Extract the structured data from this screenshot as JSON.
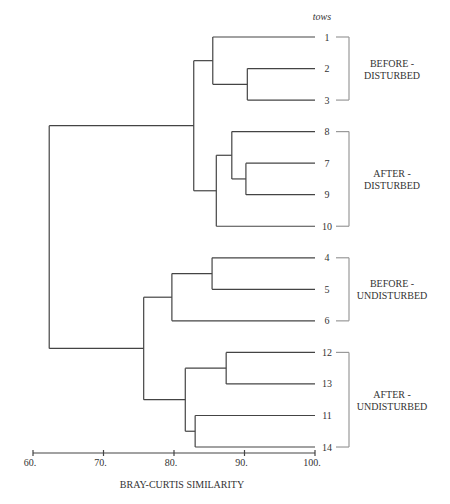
{
  "chart_data": {
    "type": "dendrogram",
    "title": "",
    "xlabel": "BRAY-CURTIS SIMILARITY",
    "leaves_header": "tows",
    "xlim": [
      60,
      100
    ],
    "x_ticks": [
      60,
      70,
      80,
      90,
      100
    ],
    "x_tick_labels": [
      "60.",
      "70.",
      "80.",
      "90.",
      "100."
    ],
    "leaf_order": [
      "1",
      "2",
      "3",
      "8",
      "7",
      "9",
      "10",
      "4",
      "5",
      "6",
      "12",
      "13",
      "11",
      "14"
    ],
    "merges": [
      {
        "id": "m23",
        "left": "2",
        "right": "3",
        "similarity": 90.4
      },
      {
        "id": "m1_23",
        "left": "1",
        "right": "m23",
        "similarity": 85.5
      },
      {
        "id": "m79",
        "left": "7",
        "right": "9",
        "similarity": 90.2
      },
      {
        "id": "m8_79",
        "left": "8",
        "right": "m79",
        "similarity": 88.2
      },
      {
        "id": "m879_10",
        "left": "m8_79",
        "right": "10",
        "similarity": 86.0
      },
      {
        "id": "mTop",
        "left": "m1_23",
        "right": "m879_10",
        "similarity": 82.8
      },
      {
        "id": "m45",
        "left": "4",
        "right": "5",
        "similarity": 85.4
      },
      {
        "id": "m45_6",
        "left": "m45",
        "right": "6",
        "similarity": 79.7
      },
      {
        "id": "m1213",
        "left": "12",
        "right": "13",
        "similarity": 87.4
      },
      {
        "id": "m1114",
        "left": "11",
        "right": "14",
        "similarity": 83.0
      },
      {
        "id": "mAU",
        "left": "m1213",
        "right": "m1114",
        "similarity": 81.6
      },
      {
        "id": "mBottom",
        "left": "m45_6",
        "right": "mAU",
        "similarity": 75.7
      },
      {
        "id": "root",
        "left": "mTop",
        "right": "mBottom",
        "similarity": 62.3
      }
    ],
    "groups": [
      {
        "label_lines": [
          "BEFORE -",
          "DISTURBED"
        ],
        "leaves": [
          "1",
          "2",
          "3"
        ]
      },
      {
        "label_lines": [
          "AFTER -",
          "DISTURBED"
        ],
        "leaves": [
          "8",
          "7",
          "9",
          "10"
        ]
      },
      {
        "label_lines": [
          "BEFORE -",
          "UNDISTURBED"
        ],
        "leaves": [
          "4",
          "5",
          "6"
        ]
      },
      {
        "label_lines": [
          "AFTER -",
          "UNDISTURBED"
        ],
        "leaves": [
          "12",
          "13",
          "11",
          "14"
        ]
      }
    ]
  },
  "layout": {
    "line_color": "#444444",
    "bracket_color": "#999999",
    "x_at_60": 33,
    "x_at_100": 315,
    "leaf_y_first": 37,
    "leaf_y_step": 31.54
  }
}
